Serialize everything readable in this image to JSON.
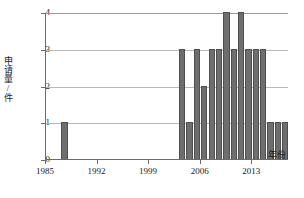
{
  "chart_data": {
    "type": "bar",
    "title": "",
    "xlabel": "年份",
    "ylabel": "申请量/件",
    "ylim": [
      0,
      4
    ],
    "xlim": [
      1985,
      2018
    ],
    "grid": true,
    "legend": null,
    "ytick_labels": [
      "0",
      "1",
      "2",
      "3",
      "4"
    ],
    "ytick_values": [
      0,
      1,
      2,
      3,
      4
    ],
    "xtick_labels": [
      "1985",
      "1992",
      "1999",
      "2006",
      "2013"
    ],
    "xtick_values": [
      1985,
      1992,
      1999,
      2006,
      2013
    ],
    "categories": [
      1987,
      2003,
      2004,
      2005,
      2006,
      2007,
      2008,
      2009,
      2010,
      2011,
      2012,
      2013,
      2014,
      2015,
      2016,
      2017
    ],
    "values": [
      1,
      3,
      1,
      3,
      2,
      3,
      3,
      4,
      3,
      4,
      3,
      3,
      3,
      1,
      1,
      1
    ],
    "bars": [
      {
        "year": 1987,
        "value": 1
      },
      {
        "year": 2003,
        "value": 3
      },
      {
        "year": 2004,
        "value": 1
      },
      {
        "year": 2005,
        "value": 3
      },
      {
        "year": 2006,
        "value": 2
      },
      {
        "year": 2007,
        "value": 3
      },
      {
        "year": 2008,
        "value": 3
      },
      {
        "year": 2009,
        "value": 4
      },
      {
        "year": 2010,
        "value": 3
      },
      {
        "year": 2011,
        "value": 4
      },
      {
        "year": 2012,
        "value": 3
      },
      {
        "year": 2013,
        "value": 3
      },
      {
        "year": 2014,
        "value": 3
      },
      {
        "year": 2015,
        "value": 1
      },
      {
        "year": 2016,
        "value": 1
      },
      {
        "year": 2017,
        "value": 1
      }
    ],
    "bar_color": "#6e6e6e",
    "grid_color": "#b9b9b9",
    "axis_color": "#6b6b6b"
  }
}
